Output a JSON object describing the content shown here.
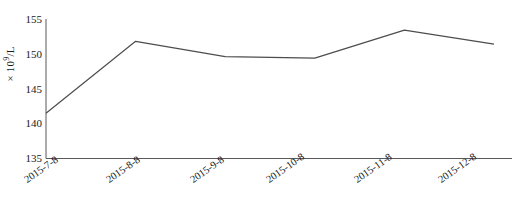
{
  "chart_data": {
    "type": "line",
    "title": "",
    "xlabel": "",
    "ylabel": "× 10⁹/L",
    "ylabel_base": "× 10",
    "ylabel_exp": "9",
    "ylabel_unit": "/L",
    "categories": [
      "2015-7-8",
      "2015-8-8",
      "2015-9-8",
      "2015-10-8",
      "2015-11-8",
      "2015-12-8"
    ],
    "values": [
      141.5,
      151.8,
      149.6,
      149.4,
      153.4,
      151.4
    ],
    "ylim": [
      135,
      155
    ],
    "yticks": [
      135,
      140,
      145,
      150,
      155
    ],
    "ytick_labels": [
      "135",
      "140",
      "145",
      "150",
      "155"
    ],
    "grid": false,
    "legend": false,
    "legend_position": "none",
    "series": [
      {
        "name": "",
        "values": [
          141.5,
          151.8,
          149.6,
          149.4,
          153.4,
          151.4
        ],
        "color": "#4d4d4d"
      }
    ],
    "line_color": "#4d4d4d",
    "axis_color": "#595959",
    "background_color": "#ffffff"
  }
}
